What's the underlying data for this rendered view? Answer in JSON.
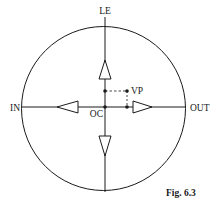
{
  "diagram": {
    "labels": {
      "top": "LE",
      "left": "IN",
      "right": "OUT",
      "center": "OC",
      "point": "VP"
    },
    "caption": "Fig. 6.3",
    "arrows": [
      "up",
      "left",
      "right",
      "down"
    ],
    "colors": {
      "stroke": "#1a1a1a",
      "background": "#ffffff"
    }
  }
}
